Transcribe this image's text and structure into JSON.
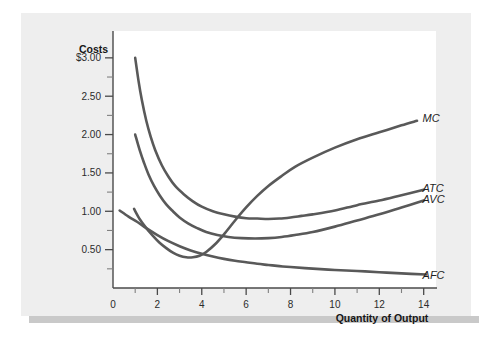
{
  "figure": {
    "background_color": "#ffffff",
    "card_color": "#eeeeee",
    "panel_color": "#ffffff",
    "shadow_color": "#c9c9c9",
    "curve_color": "#595959",
    "axis_color": "#4a4a4a"
  },
  "chart_data": {
    "type": "line",
    "title": "",
    "subtitle": "",
    "xlabel": "Quantity of Output",
    "ylabel": "Costs",
    "xlim": [
      0,
      14.6
    ],
    "ylim": [
      0,
      3.35
    ],
    "grid": false,
    "legend_position": "right-inline-labels",
    "x_ticks_major": [
      0,
      2,
      4,
      6,
      8,
      10,
      12,
      14
    ],
    "x_tick_labels": [
      "0",
      "2",
      "4",
      "6",
      "8",
      "10",
      "12",
      "14"
    ],
    "x_ticks_minor": [
      1,
      3,
      5,
      7,
      9,
      11,
      13
    ],
    "y_ticks_major": [
      0.5,
      1.0,
      1.5,
      2.0,
      2.5,
      3.0
    ],
    "y_tick_labels": [
      "0.50",
      "1.00",
      "1.50",
      "2.00",
      "2.50",
      "$3.00"
    ],
    "y_ticks_minor": [
      0.25,
      0.75,
      1.25,
      1.75,
      2.25,
      2.75
    ],
    "series": [
      {
        "name": "MC",
        "label": "MC",
        "label_x": 13.95,
        "label_y": 2.22,
        "points": [
          [
            0.95,
            1.03
          ],
          [
            1.2,
            0.9
          ],
          [
            1.5,
            0.78
          ],
          [
            1.8,
            0.68
          ],
          [
            2.1,
            0.59
          ],
          [
            2.4,
            0.52
          ],
          [
            2.7,
            0.46
          ],
          [
            3.0,
            0.42
          ],
          [
            3.3,
            0.4
          ],
          [
            3.6,
            0.4
          ],
          [
            3.9,
            0.42
          ],
          [
            4.2,
            0.47
          ],
          [
            4.6,
            0.57
          ],
          [
            5.0,
            0.7
          ],
          [
            5.5,
            0.88
          ],
          [
            6.0,
            1.05
          ],
          [
            6.5,
            1.2
          ],
          [
            7.0,
            1.33
          ],
          [
            7.6,
            1.46
          ],
          [
            8.2,
            1.58
          ],
          [
            9.0,
            1.7
          ],
          [
            10.0,
            1.83
          ],
          [
            11.0,
            1.94
          ],
          [
            12.0,
            2.03
          ],
          [
            13.0,
            2.12
          ],
          [
            13.7,
            2.18
          ]
        ]
      },
      {
        "name": "ATC",
        "label": "ATC",
        "label_x": 13.95,
        "label_y": 1.31,
        "points": [
          [
            1.0,
            3.0
          ],
          [
            1.15,
            2.7
          ],
          [
            1.3,
            2.45
          ],
          [
            1.5,
            2.18
          ],
          [
            1.7,
            1.97
          ],
          [
            1.9,
            1.8
          ],
          [
            2.2,
            1.6
          ],
          [
            2.5,
            1.45
          ],
          [
            2.8,
            1.33
          ],
          [
            3.2,
            1.22
          ],
          [
            3.6,
            1.13
          ],
          [
            4.0,
            1.06
          ],
          [
            4.5,
            1.0
          ],
          [
            5.0,
            0.96
          ],
          [
            5.5,
            0.93
          ],
          [
            6.0,
            0.91
          ],
          [
            6.5,
            0.905
          ],
          [
            7.0,
            0.9
          ],
          [
            7.5,
            0.905
          ],
          [
            8.0,
            0.92
          ],
          [
            8.5,
            0.94
          ],
          [
            9.0,
            0.96
          ],
          [
            10.0,
            1.01
          ],
          [
            11.0,
            1.08
          ],
          [
            12.0,
            1.14
          ],
          [
            13.0,
            1.21
          ],
          [
            14.0,
            1.28
          ]
        ]
      },
      {
        "name": "AVC",
        "label": "AVC",
        "label_x": 13.95,
        "label_y": 1.16,
        "points": [
          [
            1.0,
            2.0
          ],
          [
            1.2,
            1.8
          ],
          [
            1.4,
            1.63
          ],
          [
            1.6,
            1.48
          ],
          [
            1.85,
            1.33
          ],
          [
            2.1,
            1.21
          ],
          [
            2.4,
            1.09
          ],
          [
            2.7,
            1.0
          ],
          [
            3.0,
            0.92
          ],
          [
            3.4,
            0.84
          ],
          [
            3.8,
            0.78
          ],
          [
            4.2,
            0.73
          ],
          [
            4.7,
            0.69
          ],
          [
            5.2,
            0.665
          ],
          [
            5.8,
            0.65
          ],
          [
            6.4,
            0.645
          ],
          [
            7.0,
            0.65
          ],
          [
            7.6,
            0.665
          ],
          [
            8.2,
            0.69
          ],
          [
            9.0,
            0.73
          ],
          [
            10.0,
            0.8
          ],
          [
            11.0,
            0.88
          ],
          [
            12.0,
            0.96
          ],
          [
            13.0,
            1.05
          ],
          [
            14.0,
            1.14
          ]
        ]
      },
      {
        "name": "AFC",
        "label": "AFC",
        "label_x": 13.95,
        "label_y": 0.17,
        "points": [
          [
            0.3,
            1.01
          ],
          [
            0.7,
            0.93
          ],
          [
            1.1,
            0.86
          ],
          [
            1.5,
            0.78
          ],
          [
            2.0,
            0.69
          ],
          [
            2.5,
            0.61
          ],
          [
            3.0,
            0.545
          ],
          [
            3.5,
            0.49
          ],
          [
            4.0,
            0.445
          ],
          [
            4.5,
            0.41
          ],
          [
            5.0,
            0.38
          ],
          [
            5.5,
            0.355
          ],
          [
            6.0,
            0.335
          ],
          [
            6.5,
            0.315
          ],
          [
            7.0,
            0.3
          ],
          [
            7.5,
            0.285
          ],
          [
            8.0,
            0.273
          ],
          [
            9.0,
            0.252
          ],
          [
            10.0,
            0.235
          ],
          [
            11.0,
            0.222
          ],
          [
            12.0,
            0.205
          ],
          [
            13.0,
            0.19
          ],
          [
            14.1,
            0.175
          ]
        ]
      }
    ]
  }
}
